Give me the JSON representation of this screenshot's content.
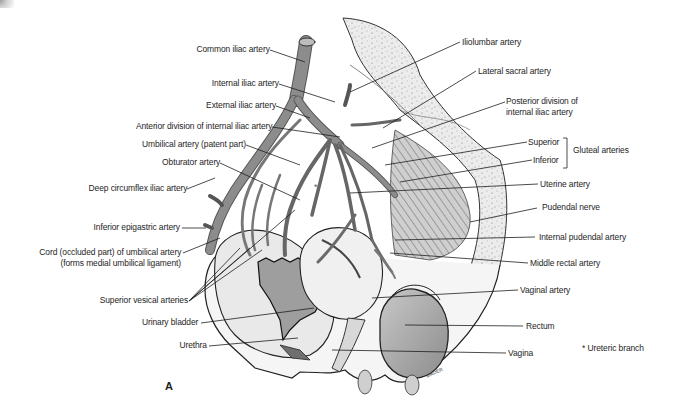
{
  "figure": {
    "panel_label": "A",
    "signature": "MADER",
    "footnote": "* Ureteric branch",
    "colors": {
      "line": "#1e1e1e",
      "vessel": "#8a8a8a",
      "vessel_dark": "#6f6f6f",
      "bone": "#e6e6e6",
      "organ": "#b5b5b5"
    }
  },
  "labels_left": [
    {
      "id": "common-iliac",
      "text": "Common iliac artery"
    },
    {
      "id": "internal-iliac",
      "text": "Internal iliac artery"
    },
    {
      "id": "external-iliac",
      "text": "External iliac artery"
    },
    {
      "id": "anterior-division",
      "text": "Anterior division of internal iliac artery"
    },
    {
      "id": "umbilical-patent",
      "text": "Umbilical artery (patent part)"
    },
    {
      "id": "obturator",
      "text": "Obturator artery"
    },
    {
      "id": "deep-circumflex",
      "text": "Deep circumflex iliac artery"
    },
    {
      "id": "inferior-epigastric",
      "text": "Inferior epigastric artery"
    },
    {
      "id": "cord-umbilical-1",
      "text": "Cord (occluded part) of umbilical artery"
    },
    {
      "id": "cord-umbilical-2",
      "text": "(forms medial umbilical ligament)"
    },
    {
      "id": "superior-vesical",
      "text": "Superior vesical arteries"
    },
    {
      "id": "urinary-bladder",
      "text": "Urinary bladder"
    },
    {
      "id": "urethra",
      "text": "Urethra"
    }
  ],
  "labels_right": [
    {
      "id": "iliolumbar",
      "text": "Iliolumbar artery"
    },
    {
      "id": "lateral-sacral",
      "text": "Lateral sacral artery"
    },
    {
      "id": "posterior-division-1",
      "text": "Posterior division of"
    },
    {
      "id": "posterior-division-2",
      "text": "internal iliac artery"
    },
    {
      "id": "gluteal-superior",
      "text": "Superior"
    },
    {
      "id": "gluteal-inferior",
      "text": "Inferior"
    },
    {
      "id": "gluteal-group",
      "text": "Gluteal arteries"
    },
    {
      "id": "uterine",
      "text": "Uterine artery"
    },
    {
      "id": "pudendal-nerve",
      "text": "Pudendal nerve"
    },
    {
      "id": "internal-pudendal",
      "text": "Internal pudendal artery"
    },
    {
      "id": "middle-rectal",
      "text": "Middle rectal artery"
    },
    {
      "id": "vaginal",
      "text": "Vaginal artery"
    },
    {
      "id": "rectum",
      "text": "Rectum"
    },
    {
      "id": "vagina",
      "text": "Vagina"
    }
  ]
}
